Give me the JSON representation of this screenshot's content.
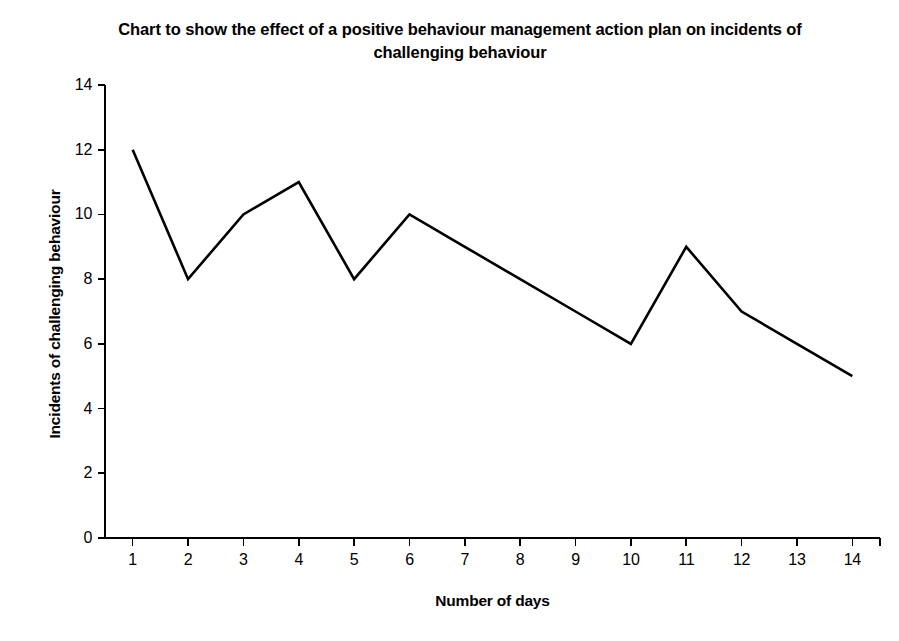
{
  "chart_data": {
    "type": "line",
    "title": "Chart to show the effect of a positive behaviour management action plan on incidents of challenging behaviour",
    "title_line1": "Chart to show the effect of a positive behaviour management action",
    "title_line2": "plan on incidents of challenging behaviour",
    "xlabel": "Number of days",
    "ylabel": "Incidents of challenging behaviour",
    "x": [
      1,
      2,
      3,
      4,
      5,
      6,
      7,
      8,
      9,
      10,
      11,
      12,
      13,
      14
    ],
    "values": [
      12,
      8,
      10,
      11,
      8,
      10,
      9,
      8,
      7,
      6,
      9,
      7,
      6,
      5
    ],
    "series": [
      {
        "name": "Incidents of challenging behaviour",
        "values": [
          12,
          8,
          10,
          11,
          8,
          10,
          9,
          8,
          7,
          6,
          9,
          7,
          6,
          5
        ]
      }
    ],
    "xticklabels": [
      "1",
      "2",
      "3",
      "4",
      "5",
      "6",
      "7",
      "8",
      "9",
      "10",
      "11",
      "12",
      "13",
      "14"
    ],
    "yticks": [
      0,
      2,
      4,
      6,
      8,
      10,
      12,
      14
    ],
    "yticklabels": [
      "0",
      "2",
      "4",
      "6",
      "8",
      "10",
      "12",
      "14"
    ],
    "xlim": [
      0.5,
      14.5
    ],
    "ylim": [
      0,
      14
    ],
    "grid": false,
    "legend": false,
    "line_color": "#000000",
    "axis_color": "#000000",
    "background_color": "#ffffff",
    "line_width": 2.6,
    "markers": false
  }
}
